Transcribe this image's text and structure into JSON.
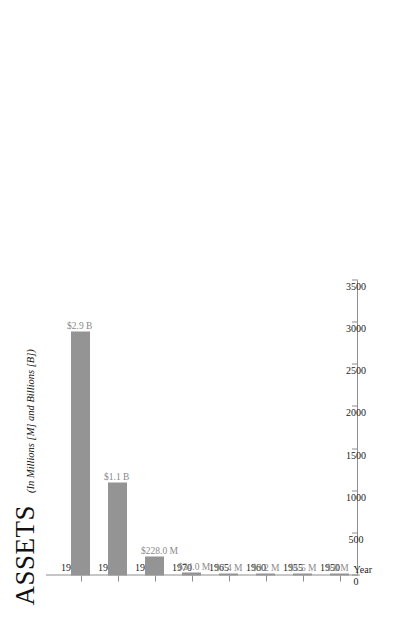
{
  "chart_data": {
    "type": "bar",
    "orientation": "horizontal-rotated",
    "title": "ASSETS",
    "subtitle": "(In Millions [M] and Billions [B])",
    "xlabel": "Year",
    "ylabel": "",
    "categories": [
      "1950",
      "1955",
      "1960",
      "1965",
      "1970",
      "1975",
      "1980",
      "1985"
    ],
    "values": [
      0.8,
      1.5,
      3.2,
      7.4,
      34.0,
      228.0,
      1100,
      2900
    ],
    "data_labels": [
      "$.8 M",
      "$1.5 M",
      "$3.2 M",
      "$7.4 M",
      "$34.0 M",
      "$228.0 M",
      "$1.1 B",
      "$2.9 B"
    ],
    "value_ticks": [
      "0",
      "500",
      "1000",
      "1500",
      "2000",
      "2500",
      "3000",
      "3500"
    ],
    "value_tick_values": [
      0,
      500,
      1000,
      1500,
      2000,
      2500,
      3000,
      3500
    ],
    "ylim": [
      0,
      3500
    ],
    "grid": false,
    "legend": false,
    "bar_color": "#949494",
    "axis_color": "#8e8e8e",
    "label_color": "#8a8a8a",
    "text_color": "#111111"
  }
}
